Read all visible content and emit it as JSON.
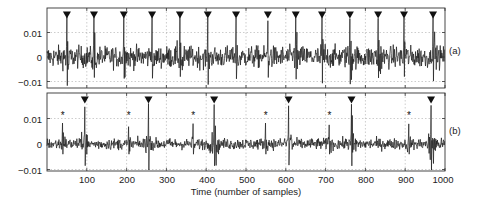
{
  "chart_data": {
    "type": "line",
    "title": "",
    "xlabel": "Time (number of samples)",
    "ylabel": "",
    "xlim": [
      0,
      1000
    ],
    "x_ticks": [
      100,
      200,
      300,
      400,
      500,
      600,
      700,
      800,
      900,
      1000
    ],
    "grid": true,
    "panels": [
      {
        "id": "a",
        "label": "(a)",
        "ylim": [
          -0.0125,
          0.02
        ],
        "y_ticks": [
          0.01,
          0,
          -0.01
        ],
        "y_tick_labels": [
          "0.01",
          "0",
          "-0.01"
        ],
        "series": [
          {
            "name": "signal (a)",
            "description": "noisy signal with periodic spikes"
          }
        ],
        "triangle_markers_x": [
          50,
          118,
          193,
          264,
          334,
          404,
          475,
          555,
          625,
          691,
          761,
          832,
          897,
          970
        ],
        "star_markers_x": []
      },
      {
        "id": "b",
        "label": "(b)",
        "ylim": [
          -0.0105,
          0.0195
        ],
        "y_ticks": [
          0.01,
          0,
          -0.01
        ],
        "y_tick_labels": [
          "0.01",
          "0",
          "-0.01"
        ],
        "series": [
          {
            "name": "signal (b)",
            "description": "noisy signal with spikes at triangle and star positions"
          }
        ],
        "triangle_markers_x": [
          95,
          255,
          420,
          607,
          765,
          965
        ],
        "star_markers_x": [
          37,
          203,
          365,
          547,
          707,
          907
        ]
      }
    ]
  },
  "axis": {
    "x_tick_labels": [
      "100",
      "200",
      "300",
      "400",
      "500",
      "600",
      "700",
      "800",
      "900",
      "1000"
    ],
    "xlabel": "Time (number of samples)"
  },
  "panels": {
    "a": {
      "label": "(a)",
      "ytick_top": "0.01",
      "ytick_mid": "0",
      "ytick_bot": "−0.01"
    },
    "b": {
      "label": "(b)",
      "ytick_top": "0.01",
      "ytick_mid": "0",
      "ytick_bot": "−0.01"
    }
  },
  "colors": {
    "line": "#1a1a1a",
    "frame": "#333333",
    "grid": "#9a9a9a",
    "marker": "#111111"
  }
}
